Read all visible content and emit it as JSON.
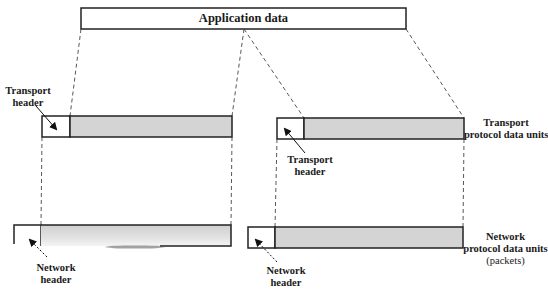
{
  "diagram": {
    "application_data": {
      "label": "Application data"
    },
    "transport_layer": {
      "left_header_label_line1": "Transport",
      "left_header_label_line2": "header",
      "right_header_label_line1": "Transport",
      "right_header_label_line2": "header",
      "pdu_label_line1": "Transport",
      "pdu_label_line2": "protocol data units"
    },
    "network_layer": {
      "left_header_label_line1": "Network",
      "left_header_label_line2": "header",
      "right_header_label_line1": "Network",
      "right_header_label_line2": "header",
      "pdu_label_line1": "Network",
      "pdu_label_line2": "protocol data units",
      "pdu_label_line3": "(packets)"
    },
    "colors": {
      "stroke": "#222222",
      "data_fill": "#d4d4d4",
      "header_fill": "#ffffff",
      "dash": "#444444"
    }
  }
}
